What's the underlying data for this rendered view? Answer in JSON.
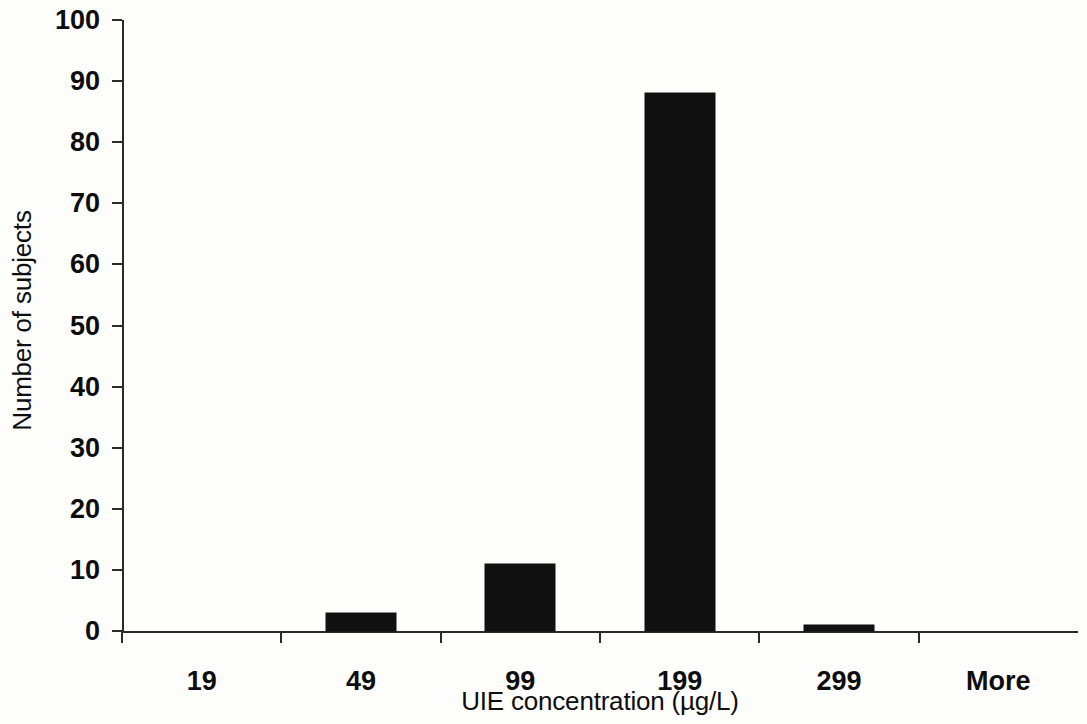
{
  "chart_data": {
    "type": "bar",
    "title": "",
    "xlabel": "UIE concentration (µg/L)",
    "ylabel": "Number of subjects",
    "categories": [
      "19",
      "49",
      "99",
      "199",
      "299",
      "More"
    ],
    "values": [
      0,
      3,
      11,
      88,
      1,
      0
    ],
    "ylim": [
      0,
      100
    ],
    "yticks": [
      0,
      10,
      20,
      30,
      40,
      50,
      60,
      70,
      80,
      90,
      100
    ],
    "ytick_labels": [
      "0",
      "10",
      "20",
      "30",
      "40",
      "50",
      "60",
      "70",
      "80",
      "90",
      "100"
    ],
    "grid": false,
    "legend": false,
    "bar_color": "#111111",
    "axis_color": "#2a2a2a",
    "background_color": "#fdfdfc",
    "bar_width_fraction": 0.44
  }
}
